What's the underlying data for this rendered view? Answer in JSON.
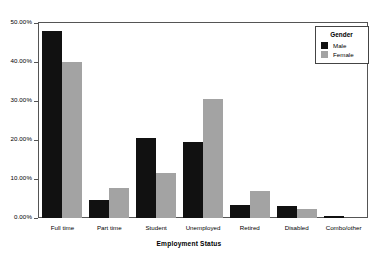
{
  "chart_data": {
    "type": "bar",
    "title": "",
    "xlabel": "Employment Status",
    "ylabel": "",
    "categories": [
      "Full time",
      "Part time",
      "Student",
      "Unemployed",
      "Retired",
      "Disabled",
      "Combo/other"
    ],
    "series": [
      {
        "name": "Male",
        "color": "#111111",
        "values": [
          48.0,
          4.5,
          20.5,
          19.5,
          3.3,
          3.0,
          0.4
        ]
      },
      {
        "name": "Female",
        "color": "#a3a3a3",
        "values": [
          40.0,
          7.7,
          11.5,
          30.5,
          6.8,
          2.2,
          0.0
        ]
      }
    ],
    "ylim": [
      0,
      50
    ],
    "yticks": [
      0,
      10,
      20,
      30,
      40,
      50
    ],
    "ytick_labels": [
      "0.00%",
      "10.00%",
      "20.00%",
      "30.00%",
      "40.00%",
      "50.00%"
    ],
    "grid": false,
    "legend_position": "top-right"
  },
  "legend": {
    "title": "Gender",
    "entries": [
      {
        "label": "Male",
        "color": "#111111"
      },
      {
        "label": "Female",
        "color": "#a3a3a3"
      }
    ]
  }
}
